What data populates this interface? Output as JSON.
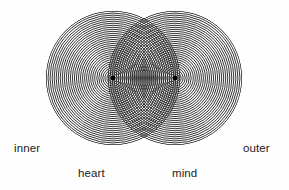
{
  "figure": {
    "background_color": "#fefefe",
    "ring_color": "#2a2a2a",
    "center_dot_color": "#000000",
    "label_color": "#1b1b1b"
  },
  "labels": {
    "inner": "inner",
    "outer": "outer",
    "heart": "heart",
    "mind": "mind"
  },
  "chart_data": {
    "type": "diagram",
    "subtype": "venn-two-circle-concentric-rings",
    "title": "",
    "xlabel": "",
    "ylabel": "",
    "canvas": {
      "width": 289,
      "height": 190
    },
    "circles": [
      {
        "name": "left-circle",
        "label": "heart",
        "center_x": 113,
        "center_y": 78,
        "radius": 67,
        "rings": 33,
        "ring_spacing": 2.03,
        "has_center_dot": true
      },
      {
        "name": "right-circle",
        "label": "mind",
        "center_x": 175,
        "center_y": 78,
        "radius": 67,
        "rings": 33,
        "ring_spacing": 2.03,
        "has_center_dot": true
      }
    ],
    "overlap": {
      "name": "lens-intersection",
      "center_separation": 62,
      "top_cusp_y": 18,
      "bottom_cusp_y": 138,
      "pattern": "moire-crosshatch"
    },
    "axis_labels": {
      "left_outside": "inner",
      "right_outside": "outer",
      "left_circle_below": "heart",
      "right_circle_below": "mind"
    },
    "grid": false,
    "legend": "none"
  }
}
